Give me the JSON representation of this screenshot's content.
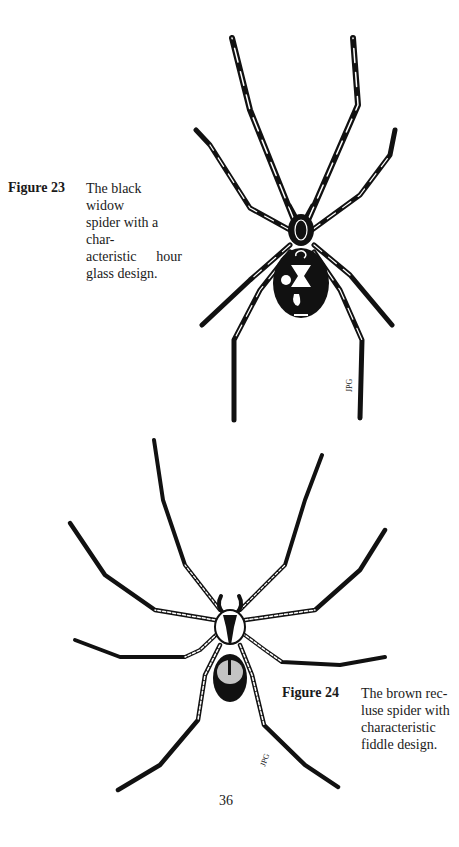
{
  "page": {
    "number": "36"
  },
  "figures": [
    {
      "label": "Figure 23",
      "caption_lines": [
        "The black widow",
        "spider with a char-",
        "acteristic hour",
        "glass design."
      ],
      "illustration": "black-widow-spider",
      "signature": "JPG"
    },
    {
      "label": "Figure 24",
      "caption_lines": [
        "The brown rec-",
        "luse spider with",
        "characteristic",
        "fiddle design."
      ],
      "illustration": "brown-recluse-spider",
      "signature": "JPG"
    }
  ],
  "colors": {
    "ink": "#111111",
    "paper": "#ffffff",
    "text": "#1a1a1a"
  }
}
